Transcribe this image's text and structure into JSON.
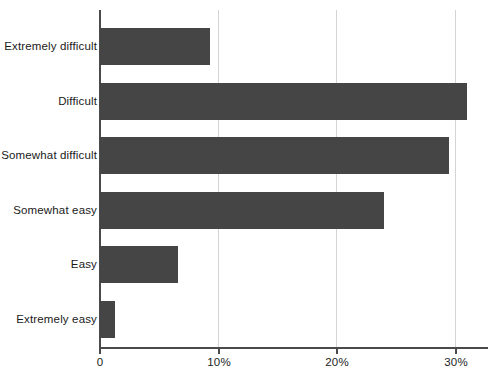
{
  "chart_data": {
    "type": "bar",
    "orientation": "horizontal",
    "title": "",
    "subtitle": "",
    "xlabel": "",
    "ylabel": "",
    "categories": [
      "Extremely difficult",
      "Difficult",
      "Somewhat difficult",
      "Somewhat easy",
      "Easy",
      "Extremely easy"
    ],
    "values": [
      9.3,
      31.0,
      29.5,
      24.0,
      6.6,
      1.3
    ],
    "value_unit": "%",
    "xlim": [
      0,
      32.8
    ],
    "xticks": [
      0,
      10,
      20,
      30
    ],
    "xtick_labels": [
      "0",
      "10%",
      "20%",
      "30%"
    ],
    "grid": "vertical-only",
    "legend": "none",
    "bar_color": "#454545",
    "gridline_color": "#d4d4d4",
    "axis_color": "#4a4a4a",
    "background_color": "#ffffff"
  }
}
